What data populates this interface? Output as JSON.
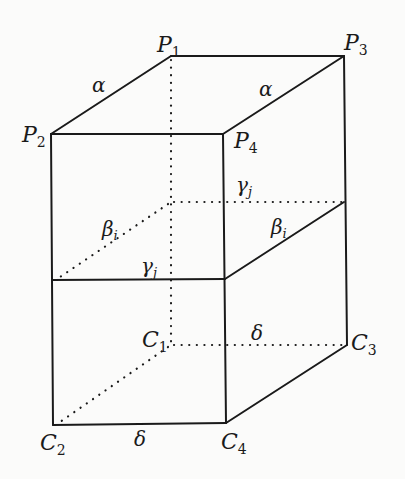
{
  "figure": {
    "vertices": {
      "P1": {
        "label": "P",
        "sub": "1"
      },
      "P2": {
        "label": "P",
        "sub": "2"
      },
      "P3": {
        "label": "P",
        "sub": "3"
      },
      "P4": {
        "label": "P",
        "sub": "4"
      },
      "C1": {
        "label": "C",
        "sub": "1"
      },
      "C2": {
        "label": "C",
        "sub": "2"
      },
      "C3": {
        "label": "C",
        "sub": "3"
      },
      "C4": {
        "label": "C",
        "sub": "4"
      }
    },
    "edge_labels": {
      "alpha_left": {
        "symbol": "α",
        "sub": ""
      },
      "alpha_right": {
        "symbol": "α",
        "sub": ""
      },
      "beta_left": {
        "symbol": "β",
        "sub": "i"
      },
      "beta_right": {
        "symbol": "β",
        "sub": "i"
      },
      "gamma_back": {
        "symbol": "γ",
        "sub": "j"
      },
      "gamma_front": {
        "symbol": "γ",
        "sub": "j"
      },
      "delta_back": {
        "symbol": "δ",
        "sub": ""
      },
      "delta_front": {
        "symbol": "δ",
        "sub": ""
      }
    }
  }
}
